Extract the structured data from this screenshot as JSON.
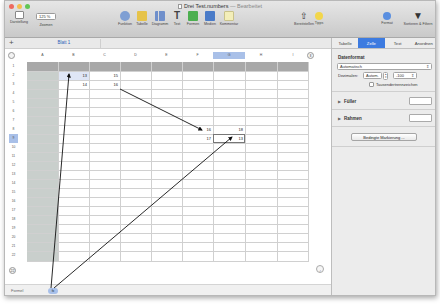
{
  "window": {
    "title": "Drei Test.numbers",
    "title_suffix": "— Bearbeitet"
  },
  "toolbar": {
    "left": [
      {
        "name": "darstellung",
        "label": "Darstellung",
        "icon": "view-icon"
      },
      {
        "name": "zoomen",
        "label": "Zoomen",
        "value": "125 %"
      }
    ],
    "center": [
      {
        "name": "funktion",
        "label": "Funktion",
        "icon": "function-icon",
        "color": "#6b8fc7"
      },
      {
        "name": "tabelle",
        "label": "Tabelle",
        "icon": "table-icon",
        "color": "#e6c34a"
      },
      {
        "name": "diagramm",
        "label": "Diagramm",
        "icon": "chart-icon",
        "color": "#6f8fcb"
      },
      {
        "name": "text",
        "label": "Text",
        "icon": "text-icon",
        "color": "#444444"
      },
      {
        "name": "formen",
        "label": "Formen",
        "icon": "shape-icon",
        "color": "#4caf50"
      },
      {
        "name": "medien",
        "label": "Medien",
        "icon": "media-icon",
        "color": "#4a7bc8"
      },
      {
        "name": "kommentar",
        "label": "Kommentar",
        "icon": "comment-icon",
        "color": "#f0e9a8"
      }
    ],
    "right": [
      {
        "name": "bereitstellen",
        "label": "Bereitstellen",
        "icon": "share-icon"
      },
      {
        "name": "tipps",
        "label": "Tipps",
        "icon": "tips-icon"
      },
      {
        "name": "format",
        "label": "Format",
        "icon": "format-icon"
      },
      {
        "name": "sortieren-filtern",
        "label": "Sortieren & Filtern",
        "icon": "filter-icon"
      }
    ]
  },
  "sheets": {
    "add_label": "+",
    "tabs": [
      {
        "label": "Blatt 1"
      }
    ]
  },
  "grid": {
    "columns": [
      "A",
      "B",
      "C",
      "D",
      "E",
      "F",
      "G",
      "H",
      "I"
    ],
    "selected_column": "G",
    "rows": [
      "1",
      "2",
      "3",
      "4",
      "5",
      "6",
      "7",
      "8",
      "9",
      "10",
      "11",
      "12",
      "13",
      "14",
      "15",
      "16",
      "17",
      "18",
      "19",
      "20",
      "21",
      "22"
    ],
    "selected_row": "9",
    "add_row_label": "22",
    "cells": [
      {
        "ref": "B2",
        "value": "13"
      },
      {
        "ref": "C2",
        "value": "15"
      },
      {
        "ref": "B3",
        "value": "14"
      },
      {
        "ref": "C3",
        "value": "16"
      },
      {
        "ref": "F8",
        "value": "16"
      },
      {
        "ref": "G8",
        "value": "18"
      },
      {
        "ref": "F9",
        "value": "17"
      },
      {
        "ref": "G9",
        "value": "13"
      }
    ]
  },
  "footer": {
    "label": "Formel",
    "badge": "fx"
  },
  "sidebar": {
    "tabs": [
      {
        "label": "Tabelle",
        "active": false
      },
      {
        "label": "Zelle",
        "active": true
      },
      {
        "label": "Text",
        "active": false
      },
      {
        "label": "Anordnen",
        "active": false
      }
    ],
    "data_format": {
      "title": "Datenformat",
      "value": "Automatisch",
      "decimals_label": "Dezimalen:",
      "decimals_value": "Autom.",
      "negative_value": "-100",
      "thousands_separator_label": "Tausendertrennzeichen",
      "thousands_separator_checked": false
    },
    "fill": {
      "label": "Füller"
    },
    "border": {
      "label": "Rahmen"
    },
    "conditional_button": "Bedingte Markierung ..."
  },
  "colors": {
    "accent": "#3d7be0",
    "selection": "#a9c0e8",
    "header_row": "#a8a8a8",
    "header_col": "#c9cfcc"
  }
}
